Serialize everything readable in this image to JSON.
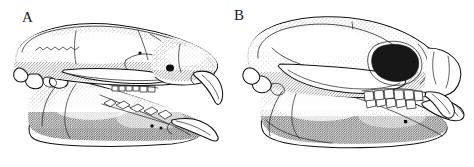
{
  "figure": {
    "kind": "scientific-line-illustration",
    "medium": "stipple-and-ink drawing",
    "background_color": "#ffffff",
    "ink_color": "#111111",
    "width": 474,
    "height": 167
  },
  "panels": [
    {
      "id": "panel-a",
      "label": "A",
      "label_x": 22,
      "label_y": 22,
      "description": "Lateral view of a skull with mandible in place; elongate rostrum, large curved ever-growing upper and lower incisors, long diastema, small cheek-tooth row, deep angular mandible",
      "parts": [
        "cranial vault",
        "frontal suture",
        "orbit",
        "zygomatic arch",
        "auditory bulla",
        "occipital region",
        "infraorbital foramen",
        "upper incisor",
        "upper cheek-tooth row",
        "diastema",
        "mandibular ramus",
        "mandibular condyle",
        "angular process",
        "lower incisor",
        "lower cheek-tooth row",
        "mental foramina"
      ]
    },
    {
      "id": "panel-b",
      "label": "B",
      "label_x": 234,
      "label_y": 20,
      "description": "Lateral view of a skull with mandible in place; globular braincase, broad deep orbit, bowed zygomatic arch, short rostrum, squared cheek-tooth row and forward-projecting procumbent anterior teeth",
      "parts": [
        "globular braincase",
        "sagittal line",
        "orbit",
        "postorbital bar",
        "zygomatic arch",
        "auditory region",
        "occipital condyle",
        "nasal region",
        "upper cheek-tooth row",
        "procumbent incisors",
        "mandibular ramus",
        "mandibular condyle",
        "angular region",
        "lower cheek-tooth row",
        "mental foramen"
      ]
    }
  ]
}
